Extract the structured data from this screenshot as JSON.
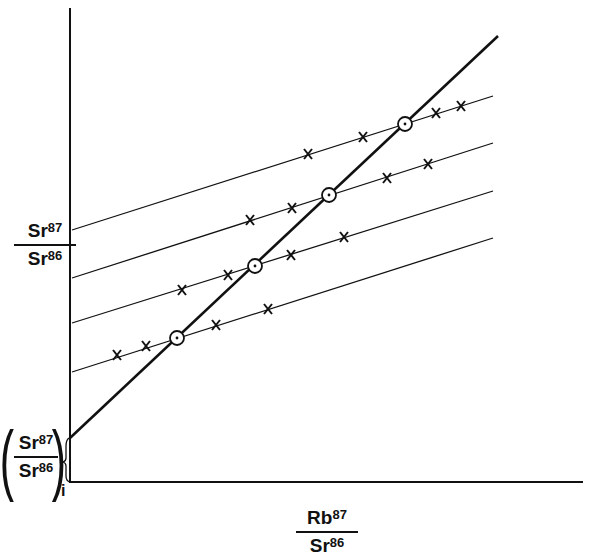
{
  "chart_data": {
    "type": "line",
    "title": "",
    "xlabel": {
      "numerator": "Rb",
      "numerator_sup": "87",
      "denominator": "Sr",
      "denominator_sup": "86"
    },
    "ylabel": {
      "numerator": "Sr",
      "numerator_sup": "87",
      "denominator": "Sr",
      "denominator_sup": "86"
    },
    "intercept_label": {
      "numerator": "Sr",
      "numerator_sup": "87",
      "denominator": "Sr",
      "denominator_sup": "86",
      "subscript": "i"
    },
    "axes": {
      "origin": [
        70,
        482
      ],
      "x_end": 583,
      "y_top": 8
    },
    "grid": false,
    "ticks": "none",
    "isochron": {
      "style": "thick",
      "from": [
        70,
        438
      ],
      "to": [
        498,
        36
      ]
    },
    "mineral_lines": [
      {
        "name": "line-1",
        "from": [
          72,
          230
        ],
        "to": [
          493,
          96
        ]
      },
      {
        "name": "line-2",
        "from": [
          72,
          278
        ],
        "to": [
          493,
          143
        ]
      },
      {
        "name": "line-3",
        "from": [
          72,
          323
        ],
        "to": [
          493,
          191
        ]
      },
      {
        "name": "line-4",
        "from": [
          72,
          372
        ],
        "to": [
          493,
          238
        ]
      }
    ],
    "whole_rock_points": [
      {
        "x": 177,
        "y": 338
      },
      {
        "x": 255,
        "y": 266
      },
      {
        "x": 329,
        "y": 195
      },
      {
        "x": 405,
        "y": 124
      }
    ],
    "mineral_points": [
      {
        "line": "line-4",
        "x": 117,
        "y": 355
      },
      {
        "line": "line-4",
        "x": 146,
        "y": 346
      },
      {
        "line": "line-4",
        "x": 216,
        "y": 325
      },
      {
        "line": "line-4",
        "x": 268,
        "y": 309
      },
      {
        "line": "line-3",
        "x": 182,
        "y": 290
      },
      {
        "line": "line-3",
        "x": 228,
        "y": 275
      },
      {
        "line": "line-3",
        "x": 291,
        "y": 255
      },
      {
        "line": "line-3",
        "x": 344,
        "y": 237
      },
      {
        "line": "line-2",
        "x": 250,
        "y": 220
      },
      {
        "line": "line-2",
        "x": 292,
        "y": 208
      },
      {
        "line": "line-2",
        "x": 387,
        "y": 178
      },
      {
        "line": "line-2",
        "x": 428,
        "y": 164
      },
      {
        "line": "line-1",
        "x": 308,
        "y": 154
      },
      {
        "line": "line-1",
        "x": 363,
        "y": 137
      },
      {
        "line": "line-1",
        "x": 436,
        "y": 113
      },
      {
        "line": "line-1",
        "x": 461,
        "y": 106
      }
    ],
    "markers": {
      "whole_rock": "circle-dot",
      "mineral": "x-cross"
    },
    "colors": {
      "ink": "#111111",
      "background": "#ffffff"
    }
  }
}
